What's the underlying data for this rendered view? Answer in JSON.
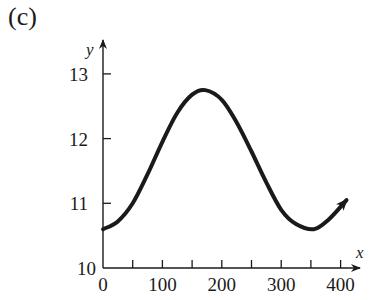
{
  "panel_label": "(c)",
  "chart_data": {
    "type": "line",
    "title": "",
    "xlabel": "x",
    "ylabel": "y",
    "xlim": [
      0,
      410
    ],
    "ylim": [
      10,
      13.4
    ],
    "x_ticks": [
      0,
      50,
      100,
      150,
      200,
      250,
      300,
      350,
      400
    ],
    "x_tick_labels": [
      "0",
      "100",
      "200",
      "300",
      "400"
    ],
    "x_tick_label_values": [
      0,
      100,
      200,
      300,
      400
    ],
    "y_ticks": [
      10,
      11,
      12,
      13
    ],
    "y_tick_labels": [
      "10",
      "11",
      "12",
      "13"
    ],
    "grid": false,
    "series": [
      {
        "name": "y(x)",
        "color": "#1a1a1a",
        "arrow_at_end": true,
        "x": [
          0,
          25,
          50,
          75,
          100,
          125,
          150,
          172,
          200,
          225,
          250,
          275,
          300,
          325,
          355,
          380,
          410
        ],
        "y": [
          10.6,
          10.72,
          11.0,
          11.45,
          11.95,
          12.4,
          12.68,
          12.75,
          12.6,
          12.25,
          11.8,
          11.32,
          10.9,
          10.68,
          10.6,
          10.75,
          11.05
        ]
      }
    ]
  }
}
